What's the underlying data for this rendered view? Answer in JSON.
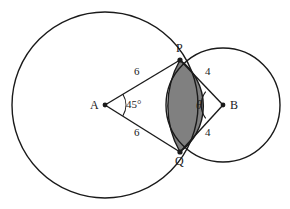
{
  "figure": {
    "type": "geometry-diagram",
    "background_color": "#ffffff",
    "stroke_color": "#1a1a1a",
    "shaded_fill_color": "#808080"
  },
  "points": [
    {
      "name": "A",
      "label": "A",
      "x": 105,
      "y": 105,
      "dot": true,
      "label_dx": -12,
      "label_dy": -6
    },
    {
      "name": "B",
      "label": "B",
      "x": 223,
      "y": 105,
      "dot": true,
      "label_dx": 6,
      "label_dy": -6
    },
    {
      "name": "P",
      "label": "P",
      "x": 180,
      "y": 60,
      "dot": true,
      "label_dx": -2,
      "label_dy": -16
    },
    {
      "name": "Q",
      "label": "Q",
      "x": 180,
      "y": 152,
      "dot": true,
      "label_dx": -3,
      "label_dy": 4
    }
  ],
  "circles": [
    {
      "name": "circle-A",
      "center": "A",
      "cx": 105,
      "cy": 105,
      "r": 93,
      "label": "large circle centered at A"
    },
    {
      "name": "circle-B",
      "center": "B",
      "cx": 223,
      "cy": 105,
      "r": 57,
      "label": "small circle centered at B"
    }
  ],
  "segments": [
    {
      "name": "segment-AP",
      "from": "A",
      "to": "P",
      "length_label": "6",
      "x1": 105,
      "y1": 105,
      "x2": 180,
      "y2": 60,
      "label_x": 137,
      "label_y": 72
    },
    {
      "name": "segment-AQ",
      "from": "A",
      "to": "Q",
      "length_label": "6",
      "x1": 105,
      "y1": 105,
      "x2": 180,
      "y2": 152,
      "label_x": 137,
      "label_y": 132
    },
    {
      "name": "segment-BP",
      "from": "B",
      "to": "P",
      "length_label": "4",
      "x1": 223,
      "y1": 105,
      "x2": 180,
      "y2": 60,
      "label_x": 206,
      "label_y": 72
    },
    {
      "name": "segment-BQ",
      "from": "B",
      "to": "Q",
      "length_label": "4",
      "x1": 223,
      "y1": 105,
      "x2": 180,
      "y2": 152,
      "label_x": 206,
      "label_y": 132
    }
  ],
  "angles": [
    {
      "name": "angle-at-A",
      "vertex": "A",
      "label": "45°",
      "label_x": 122,
      "label_y": 100,
      "arc_radius": 18
    },
    {
      "name": "angle-at-B",
      "vertex": "B",
      "label": "θ",
      "label_x": 196,
      "label_y": 99,
      "arc_radius": 20
    }
  ],
  "shaded_region": {
    "name": "lens-overlap",
    "label": "shaded lens between P and Q",
    "fill": "#808080"
  }
}
